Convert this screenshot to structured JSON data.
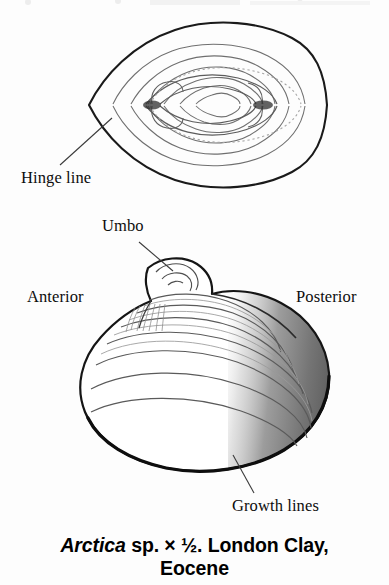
{
  "figure": {
    "background_color": "#fdfdfd",
    "ink_color": "#111111",
    "shading_color": "#8d8d8d",
    "labels": {
      "hinge_line": "Hinge line",
      "umbo": "Umbo",
      "anterior": "Anterior",
      "posterior": "Posterior",
      "growth_lines": "Growth lines"
    },
    "caption": {
      "genus": "Arctica",
      "species": " sp. ",
      "multiplier": "× ",
      "scale": "½",
      "locality": ". London Clay,",
      "epoch": "Eocene",
      "full_text": "Arctica sp. × ½. London Clay, Eocene"
    },
    "views": {
      "upper": "dorsal-view-both-valves",
      "lower": "lateral-view-left-valve"
    }
  }
}
